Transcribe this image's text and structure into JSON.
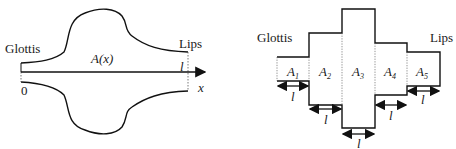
{
  "left_diagram": {
    "label_glottis": "Glottis",
    "label_lips": "Lips",
    "label_area": "A(x)",
    "label_origin": "0",
    "label_length": "l",
    "label_axis": "x"
  },
  "right_diagram": {
    "label_glottis": "Glottis",
    "label_lips": "Lips",
    "sections": [
      {
        "label": "A",
        "sub": "1",
        "length": "l"
      },
      {
        "label": "A",
        "sub": "2",
        "length": "l"
      },
      {
        "label": "A",
        "sub": "3",
        "length": "l"
      },
      {
        "label": "A",
        "sub": "4",
        "length": "l"
      },
      {
        "label": "A",
        "sub": "5",
        "length": "l"
      }
    ]
  }
}
